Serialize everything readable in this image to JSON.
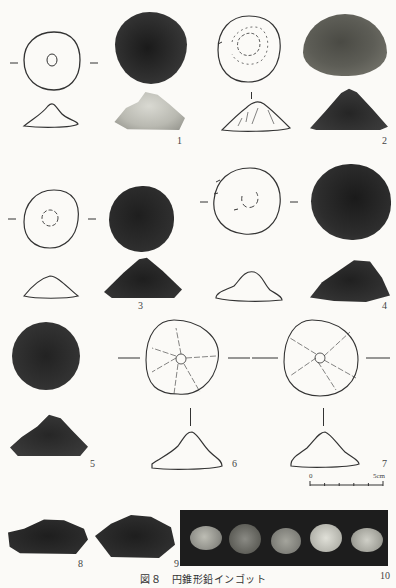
{
  "figure": {
    "caption": "図８　円錐形鉛インゴット",
    "items": [
      {
        "number": "1"
      },
      {
        "number": "2"
      },
      {
        "number": "3"
      },
      {
        "number": "4"
      },
      {
        "number": "5"
      },
      {
        "number": "6"
      },
      {
        "number": "7"
      },
      {
        "number": "8"
      },
      {
        "number": "9"
      },
      {
        "number": "10"
      }
    ],
    "scale_bar": {
      "start_label": "0",
      "end_label": "5cm"
    }
  },
  "colors": {
    "background": "#fbfaf7",
    "ink": "#333333",
    "photo_dark": "#2b2b2b",
    "photo_light": "#cfcfc8"
  }
}
